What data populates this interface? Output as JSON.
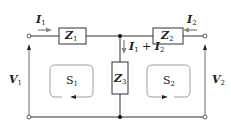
{
  "diagram": {
    "type": "two-port T network circuit",
    "components": {
      "z1": {
        "symbol": "Z",
        "sub": "1"
      },
      "z2": {
        "symbol": "Z",
        "sub": "2"
      },
      "z3": {
        "symbol": "Z",
        "sub": "3"
      }
    },
    "currents": {
      "i1": {
        "symbol": "I",
        "sub": "1"
      },
      "i2": {
        "symbol": "I",
        "sub": "2"
      },
      "i_sum": {
        "a": "I",
        "a_sub": "1",
        "op": " + ",
        "b": "I",
        "b_sub": "2"
      }
    },
    "voltages": {
      "v1": {
        "symbol": "V",
        "sub": "1"
      },
      "v2": {
        "symbol": "V",
        "sub": "2"
      }
    },
    "loops": {
      "s1": {
        "symbol": "S",
        "sub": "1",
        "direction": "counterclockwise"
      },
      "s2": {
        "symbol": "S",
        "sub": "2",
        "direction": "clockwise"
      }
    },
    "colors": {
      "wire": "#333333",
      "arrow": "#888888",
      "loop": "#777777"
    }
  }
}
